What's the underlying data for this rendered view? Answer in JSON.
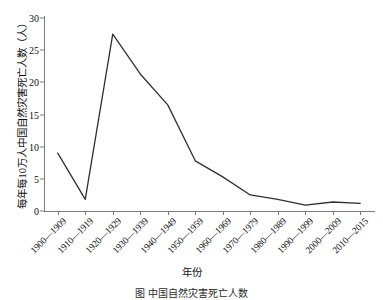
{
  "chart_data": {
    "type": "line",
    "title": "",
    "subtitle": "",
    "xlabel": "年份",
    "ylabel": "每年每10万人中国自然灾害死亡人数（人）",
    "categories": [
      "1900—1909",
      "1910—1919",
      "1920—1929",
      "1930—1939",
      "1940—1949",
      "1950—1959",
      "1960—1969",
      "1970—1979",
      "1980—1989",
      "1990—1999",
      "2000—2009",
      "2010—2015"
    ],
    "values": [
      9.0,
      1.8,
      27.5,
      21.3,
      16.5,
      7.8,
      5.3,
      2.5,
      1.8,
      0.9,
      1.4,
      1.2
    ],
    "ylim": [
      0,
      30
    ],
    "yticks": [
      0,
      5,
      10,
      15,
      20,
      25,
      30
    ],
    "ytick_labels": [
      "0",
      "5",
      "10",
      "15",
      "20",
      "25",
      "30"
    ],
    "grid": false,
    "legend": null,
    "series_color": "#303030",
    "axis_color": "#7d7d7d",
    "background": "#ffffff"
  },
  "figure": {
    "caption": "图  中国自然灾害死亡人数"
  }
}
